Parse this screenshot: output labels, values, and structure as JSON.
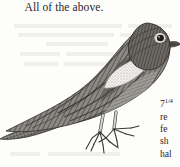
{
  "page": {
    "background_color": "#fdfdfc",
    "ink_color": "#2a2722"
  },
  "headline": {
    "text": "All of the above."
  },
  "figure": {
    "name": "bird-engraving",
    "features": {
      "wing_patch": "white speckled wing bar",
      "eye": "dark pupil with light ring",
      "tail": "long, striated, pointing lower-left",
      "legs": "two, pale, with splayed clawed toes"
    },
    "tones": {
      "body_dark": "#5d5a55",
      "body_mid": "#8a8782",
      "body_light": "#b8b5b0",
      "wing_patch": "#f2f1ee",
      "outline": "#3b3833"
    }
  },
  "caption": {
    "lines": [
      {
        "text": "7",
        "fraction": "1/4"
      },
      {
        "text": "re"
      },
      {
        "text": "fe"
      },
      {
        "text": "sh"
      },
      {
        "text": "hal"
      }
    ]
  },
  "ghost_text": {
    "note": "faint bleed-through from the reverse side of the page, illegible"
  }
}
